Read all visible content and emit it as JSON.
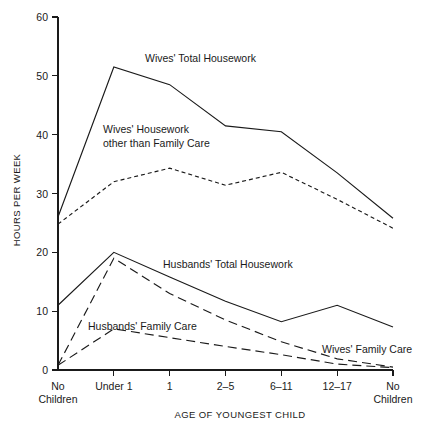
{
  "chart_data": {
    "type": "line",
    "title": "",
    "xlabel": "AGE OF YOUNGEST CHILD",
    "ylabel": "HOURS PER WEEK",
    "categories": [
      "No Children",
      "Under 1",
      "1",
      "2–5",
      "6–11",
      "12–17",
      "No Children"
    ],
    "xtick_labels_line1": [
      "No",
      "Under 1",
      "1",
      "2–5",
      "6–11",
      "12–17",
      "No"
    ],
    "xtick_labels_line2": [
      "Children",
      "",
      "",
      "",
      "",
      "",
      "Children"
    ],
    "yticks": [
      0,
      10,
      20,
      30,
      40,
      50,
      60
    ],
    "ylim": [
      0,
      60
    ],
    "grid": false,
    "legend_position": "inline-annotations",
    "series": [
      {
        "name": "Wives' Total Housework",
        "style": "solid",
        "values": [
          26.0,
          51.5,
          48.5,
          41.5,
          40.5,
          33.5,
          25.8
        ],
        "label": "Wives' Total Housework",
        "label_x": 145,
        "label_y": 62
      },
      {
        "name": "Wives' Housework other than Family Care",
        "style": "dotted",
        "values": [
          24.8,
          32.0,
          34.3,
          31.4,
          33.6,
          29.0,
          24.1
        ],
        "label_line1": "Wives' Housework",
        "label_line2": "other than Family Care",
        "label_x": 103,
        "label_y": 133
      },
      {
        "name": "Husbands' Total Housework",
        "style": "solid",
        "values": [
          11.0,
          20.0,
          15.8,
          11.7,
          8.2,
          11.0,
          7.3
        ],
        "label": "Husbands' Total Housework",
        "label_x": 163,
        "label_y": 268
      },
      {
        "name": "Husbands' Family Care",
        "style": "dashed",
        "values": [
          0.8,
          19.0,
          13.0,
          8.5,
          4.8,
          1.9,
          0.5
        ],
        "label": "Husbands' Family Care",
        "label_x": 88,
        "label_y": 330
      },
      {
        "name": "Wives' Family Care",
        "style": "dashed",
        "values": [
          0.8,
          7.0,
          5.5,
          4.0,
          2.6,
          1.0,
          0.4
        ],
        "label": "Wives' Family Care",
        "label_x": 322,
        "label_y": 353
      }
    ],
    "plot_geometry": {
      "x_left": 58,
      "x_right": 393,
      "y_zero": 370,
      "y_top": 17
    }
  }
}
